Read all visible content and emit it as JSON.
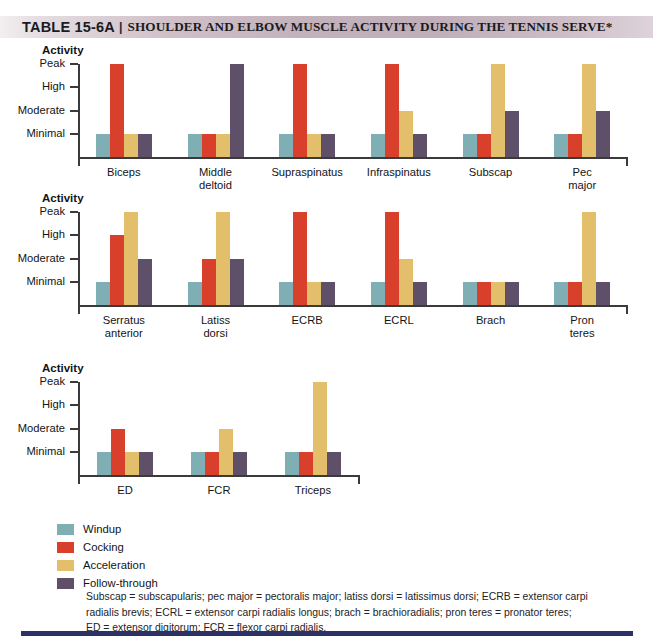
{
  "header": {
    "table_number": "TABLE 15-6A",
    "separator": "|",
    "title": "SHOULDER AND ELBOW MUSCLE ACTIVITY DURING THE TENNIS SERVE*"
  },
  "axis": {
    "y_title": "Activity",
    "tick_labels": [
      "Peak",
      "High",
      "Moderate",
      "Minimal"
    ]
  },
  "legend": {
    "items": [
      {
        "label": "Windup",
        "color": "#7FAFB5"
      },
      {
        "label": "Cocking",
        "color": "#D9402B"
      },
      {
        "label": "Acceleration",
        "color": "#E3BE6B"
      },
      {
        "label": "Follow-through",
        "color": "#5E5068"
      }
    ]
  },
  "footnote": {
    "line1": "Subscap = subscapularis; pec major = pectoralis major; latiss dorsi = latissimus dorsi; ECRB = extensor carpi",
    "line2": "radialis brevis; ECRL = extensor carpi radialis longus; brach = brachioradialis; pron teres = pronator teres;",
    "line3": "ED = extensor digitorum; FCR = flexor carpi radialis."
  },
  "chart_data": [
    {
      "id": "chart-1",
      "type": "bar",
      "title": "",
      "ylabel": "Activity",
      "xlabel": "",
      "grid": false,
      "legend_position": "below-all-charts",
      "y_tick_labels": [
        "Minimal",
        "Moderate",
        "High",
        "Peak"
      ],
      "y_tick_values": [
        1,
        2,
        3,
        4
      ],
      "ylim": [
        0,
        4
      ],
      "categories": [
        "Biceps",
        "Middle\ndeltoid",
        "Supraspinatus",
        "Infraspinatus",
        "Subscap",
        "Pec\nmajor"
      ],
      "series": [
        {
          "name": "Windup",
          "color": "#7FAFB5",
          "values": [
            1,
            1,
            1,
            1,
            1,
            1
          ]
        },
        {
          "name": "Cocking",
          "color": "#D9402B",
          "values": [
            4,
            1,
            4,
            4,
            1,
            1
          ]
        },
        {
          "name": "Acceleration",
          "color": "#E3BE6B",
          "values": [
            1,
            1,
            1,
            2,
            4,
            4
          ]
        },
        {
          "name": "Follow-through",
          "color": "#5E5068",
          "values": [
            1,
            4,
            1,
            1,
            2,
            2
          ]
        }
      ]
    },
    {
      "id": "chart-2",
      "type": "bar",
      "title": "",
      "ylabel": "Activity",
      "xlabel": "",
      "grid": false,
      "y_tick_labels": [
        "Minimal",
        "Moderate",
        "High",
        "Peak"
      ],
      "y_tick_values": [
        1,
        2,
        3,
        4
      ],
      "ylim": [
        0,
        4
      ],
      "categories": [
        "Serratus\nanterior",
        "Latiss\ndorsi",
        "ECRB",
        "ECRL",
        "Brach",
        "Pron\nteres"
      ],
      "series": [
        {
          "name": "Windup",
          "color": "#7FAFB5",
          "values": [
            1,
            1,
            1,
            1,
            1,
            1
          ]
        },
        {
          "name": "Cocking",
          "color": "#D9402B",
          "values": [
            3,
            2,
            4,
            4,
            1,
            1
          ]
        },
        {
          "name": "Acceleration",
          "color": "#E3BE6B",
          "values": [
            4,
            4,
            1,
            2,
            1,
            4
          ]
        },
        {
          "name": "Follow-through",
          "color": "#5E5068",
          "values": [
            2,
            2,
            1,
            1,
            1,
            1
          ]
        }
      ]
    },
    {
      "id": "chart-3",
      "type": "bar",
      "title": "",
      "ylabel": "Activity",
      "xlabel": "",
      "grid": false,
      "y_tick_labels": [
        "Minimal",
        "Moderate",
        "High",
        "Peak"
      ],
      "y_tick_values": [
        1,
        2,
        3,
        4
      ],
      "ylim": [
        0,
        4
      ],
      "categories": [
        "ED",
        "FCR",
        "Triceps"
      ],
      "series": [
        {
          "name": "Windup",
          "color": "#7FAFB5",
          "values": [
            1,
            1,
            1
          ]
        },
        {
          "name": "Cocking",
          "color": "#D9402B",
          "values": [
            2,
            1,
            1
          ]
        },
        {
          "name": "Acceleration",
          "color": "#E3BE6B",
          "values": [
            1,
            2,
            4
          ]
        },
        {
          "name": "Follow-through",
          "color": "#5E5068",
          "values": [
            1,
            1,
            1
          ]
        }
      ]
    }
  ]
}
